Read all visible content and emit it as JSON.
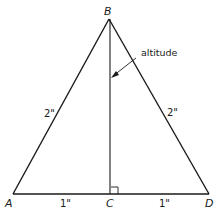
{
  "diagram": {
    "type": "geometry",
    "colors": {
      "stroke": "#1a1a1a",
      "background": "#ffffff"
    },
    "points": {
      "A": {
        "label": "A",
        "x": 13,
        "y": 194
      },
      "B": {
        "label": "B",
        "x": 109,
        "y": 19
      },
      "C": {
        "label": "C",
        "x": 110,
        "y": 194
      },
      "D": {
        "label": "D",
        "x": 209,
        "y": 194
      }
    },
    "measurements": {
      "AB": "2\"",
      "BD": "2\"",
      "AC": "1\"",
      "CD": "1\""
    },
    "annotation": {
      "text": "altitude",
      "target": "BC"
    }
  }
}
